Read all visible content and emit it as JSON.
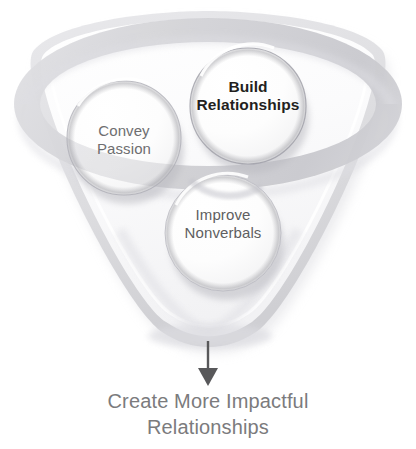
{
  "diagram": {
    "title_text": "",
    "background_color": "#ffffff",
    "nodes": [
      {
        "id": "build-relationships",
        "label": "Build\nRelationships",
        "text_color": "#231f20",
        "bold": true,
        "shape": "circle",
        "cx": 248,
        "cy": 106,
        "r": 58
      },
      {
        "id": "convey-passion",
        "label": "Convey\nPassion",
        "text_color": "#6e6e70",
        "bold": false,
        "shape": "circle",
        "cx": 124,
        "cy": 138,
        "r": 57
      },
      {
        "id": "improve-nonverbals",
        "label": "Improve\nNonverbals",
        "text_color": "#5f5f61",
        "bold": false,
        "shape": "circle",
        "cx": 223,
        "cy": 233,
        "r": 58
      }
    ],
    "arrow": {
      "name": "down-arrow",
      "color": "#58585a",
      "from_x": 208,
      "from_y": 341,
      "to_x": 208,
      "to_y": 383
    },
    "caption": {
      "text": "Create More Impactful\nRelationships",
      "color": "#7b7b7d"
    },
    "backdrop": {
      "shape": "rounded-triangle-plate",
      "ring": "ellipse-ring",
      "fill": "#fbfbfb",
      "edge": "#d8d8da"
    }
  }
}
